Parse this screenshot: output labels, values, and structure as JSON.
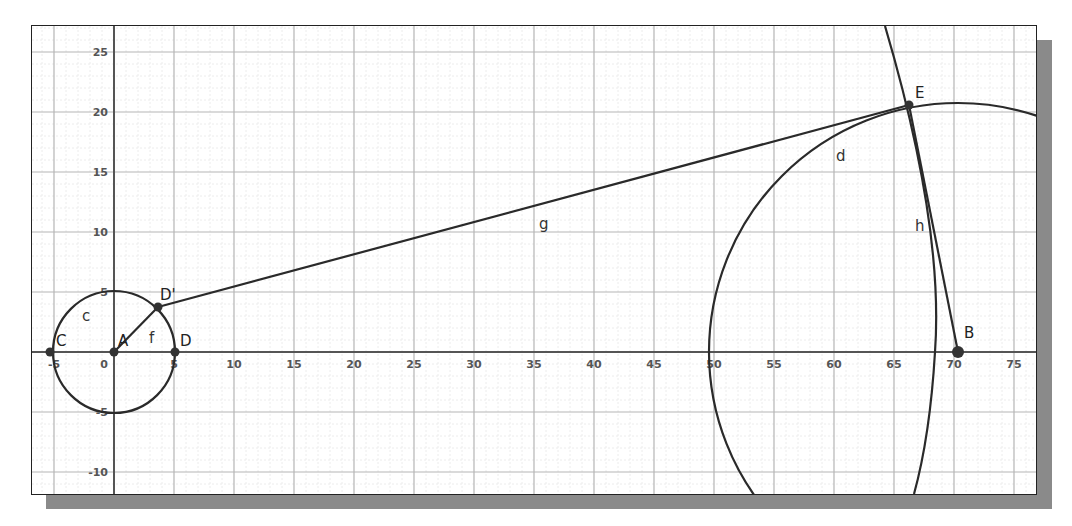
{
  "view": {
    "type": "geometry-graphics-view",
    "origin_px": [
      82,
      326
    ],
    "unit_px": 12,
    "x_ticks": [
      "-5",
      "0",
      "5",
      "10",
      "15",
      "20",
      "25",
      "30",
      "35",
      "40",
      "45",
      "50",
      "55",
      "60",
      "65",
      "70",
      "75"
    ],
    "y_ticks": [
      "25",
      "20",
      "15",
      "10",
      "5",
      "-5",
      "-10"
    ],
    "colors": {
      "object": "#2a2a2a",
      "major_grid": "#b5b5b5",
      "minor_grid": "#ececec",
      "axis": "#555555",
      "shadow": "#8a8a8a"
    }
  },
  "points": {
    "A": {
      "label": "A",
      "x": 0,
      "y": 0
    },
    "C": {
      "label": "C",
      "x": -5.3,
      "y": 0
    },
    "D": {
      "label": "D",
      "x": 5.1,
      "y": 0
    },
    "D_prime": {
      "label": "D'",
      "x": 3.6,
      "y": 3.75
    },
    "E": {
      "label": "E",
      "x": 66.25,
      "y": 20.6
    },
    "B": {
      "label": "B",
      "x": 70.3,
      "y": 0
    }
  },
  "objects": {
    "c": {
      "label": "c",
      "type": "circle",
      "center": "A",
      "radius": 5
    },
    "d": {
      "label": "d",
      "type": "circle",
      "center": "B",
      "radius": 20.75
    },
    "f": {
      "label": "f",
      "type": "segment",
      "from": "A",
      "to": "D'"
    },
    "g": {
      "label": "g",
      "type": "segment",
      "from": "D'",
      "to": "E"
    },
    "h": {
      "label": "h",
      "type": "segment",
      "from": "E",
      "to": "B"
    },
    "arc": {
      "label": "",
      "type": "circle-arc",
      "through": "E"
    }
  }
}
